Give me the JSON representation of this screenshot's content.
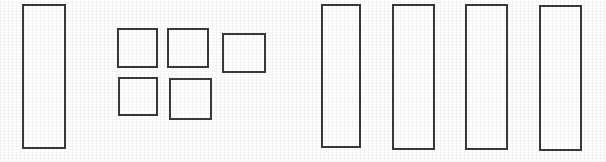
{
  "document": {
    "title": "Rectangle Outline Figure",
    "description": "Scanned line drawing containing five tall vertical rectangles and five small squares",
    "background_color": "#fefefe",
    "stroke_color": "#3a3a3a",
    "canvas": {
      "width": 606,
      "height": 162
    }
  },
  "shapes": [
    {
      "id": "tall-rectangle-1",
      "kind": "tall-rectangle",
      "group": "left",
      "x": 22,
      "y": 4,
      "width": 44,
      "height": 145,
      "stroke": "#3a3a3a",
      "stroke_width": 2,
      "fill": "#ffffff"
    },
    {
      "id": "square-top-1",
      "kind": "square",
      "group": "square-grid",
      "row": 1,
      "column": 1,
      "x": 117,
      "y": 28,
      "width": 41,
      "height": 40,
      "stroke": "#3a3a3a",
      "stroke_width": 2,
      "fill": "#ffffff"
    },
    {
      "id": "square-top-2",
      "kind": "square",
      "group": "square-grid",
      "row": 1,
      "column": 2,
      "x": 167,
      "y": 28,
      "width": 42,
      "height": 40,
      "stroke": "#3a3a3a",
      "stroke_width": 2,
      "fill": "#ffffff"
    },
    {
      "id": "square-top-3",
      "kind": "square",
      "group": "square-grid",
      "row": 1,
      "column": 3,
      "x": 222,
      "y": 33,
      "width": 44,
      "height": 40,
      "stroke": "#3a3a3a",
      "stroke_width": 2,
      "fill": "#ffffff"
    },
    {
      "id": "square-bottom-1",
      "kind": "square",
      "group": "square-grid",
      "row": 2,
      "column": 1,
      "x": 118,
      "y": 77,
      "width": 40,
      "height": 39,
      "stroke": "#3a3a3a",
      "stroke_width": 2,
      "fill": "#ffffff"
    },
    {
      "id": "square-bottom-2",
      "kind": "square",
      "group": "square-grid",
      "row": 2,
      "column": 2,
      "x": 169,
      "y": 78,
      "width": 43,
      "height": 42,
      "stroke": "#3a3a3a",
      "stroke_width": 2,
      "fill": "#ffffff"
    },
    {
      "id": "tall-rectangle-2",
      "kind": "tall-rectangle",
      "group": "right",
      "x": 321,
      "y": 4,
      "width": 40,
      "height": 144,
      "stroke": "#3a3a3a",
      "stroke_width": 2,
      "fill": "#ffffff"
    },
    {
      "id": "tall-rectangle-3",
      "kind": "tall-rectangle",
      "group": "right",
      "x": 392,
      "y": 4,
      "width": 43,
      "height": 146,
      "stroke": "#3a3a3a",
      "stroke_width": 2,
      "fill": "#ffffff"
    },
    {
      "id": "tall-rectangle-4",
      "kind": "tall-rectangle",
      "group": "right",
      "x": 465,
      "y": 4,
      "width": 43,
      "height": 146,
      "stroke": "#3a3a3a",
      "stroke_width": 2,
      "fill": "#ffffff"
    },
    {
      "id": "tall-rectangle-5",
      "kind": "tall-rectangle",
      "group": "right",
      "x": 539,
      "y": 5,
      "width": 43,
      "height": 146,
      "stroke": "#3a3a3a",
      "stroke_width": 2,
      "fill": "#ffffff"
    }
  ]
}
